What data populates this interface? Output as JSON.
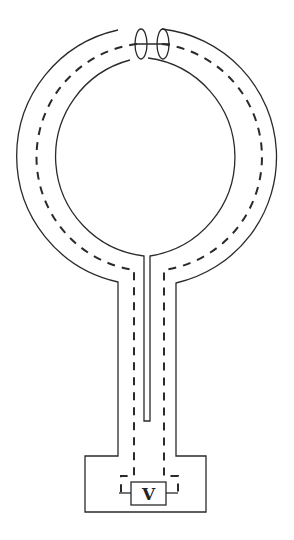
{
  "diagram": {
    "title": "",
    "components": [
      {
        "id": "loop",
        "type": "coaxial-ring",
        "description": "Circular coaxial loop with gap at top"
      },
      {
        "id": "gap",
        "type": "gap",
        "description": "Cut in shield at top of loop"
      },
      {
        "id": "stem",
        "type": "coaxial-stem",
        "description": "Vertical coaxial feed from loop to base"
      },
      {
        "id": "base",
        "type": "enclosure",
        "description": "Rectangular base box"
      },
      {
        "id": "voltmeter",
        "type": "meter",
        "label": "V"
      }
    ],
    "colors": {
      "line": "#2a2a2a",
      "background": "#ffffff"
    }
  }
}
